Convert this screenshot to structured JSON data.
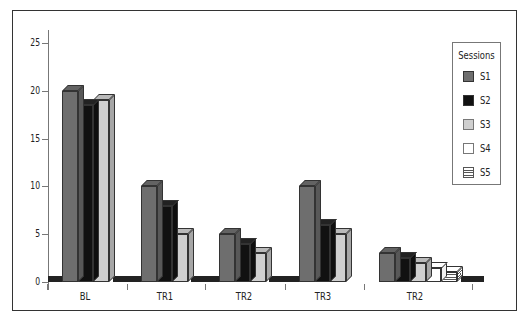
{
  "chart_data": {
    "type": "bar",
    "style": "3d-clustered",
    "title": "",
    "xlabel": "",
    "ylabel": "",
    "ylim": [
      0,
      25
    ],
    "yticks": [
      0,
      5,
      10,
      15,
      20,
      25
    ],
    "grid": false,
    "legend_position": "right",
    "legend_title": "Sessions",
    "categories": [
      "BL",
      "TR1",
      "TR2",
      "TR3",
      "TR2"
    ],
    "series": [
      {
        "name": "S1",
        "color": "#6e6e6e",
        "fill": "solid",
        "values": [
          20,
          10,
          5,
          10,
          3
        ]
      },
      {
        "name": "S2",
        "color": "#111111",
        "fill": "solid",
        "values": [
          18.5,
          8,
          4,
          6,
          2.5
        ]
      },
      {
        "name": "S3",
        "color": "#cfcfcf",
        "fill": "solid",
        "values": [
          19,
          5,
          3,
          5,
          2
        ]
      },
      {
        "name": "S4",
        "color": "#ffffff",
        "fill": "solid",
        "values": [
          null,
          null,
          null,
          null,
          1.5
        ]
      },
      {
        "name": "S5",
        "color": "#ffffff",
        "fill": "horizontal-stripes",
        "values": [
          null,
          null,
          null,
          null,
          1
        ]
      }
    ]
  },
  "legend": {
    "title": "Sessions",
    "items": [
      {
        "label": "S1"
      },
      {
        "label": "S2"
      },
      {
        "label": "S3"
      },
      {
        "label": "S4"
      },
      {
        "label": "S5"
      }
    ]
  },
  "axis": {
    "y_labels": [
      "0",
      "5",
      "10",
      "15",
      "20",
      "25"
    ],
    "x_labels": [
      "BL",
      "TR1",
      "TR2",
      "TR3",
      "TR2"
    ]
  }
}
